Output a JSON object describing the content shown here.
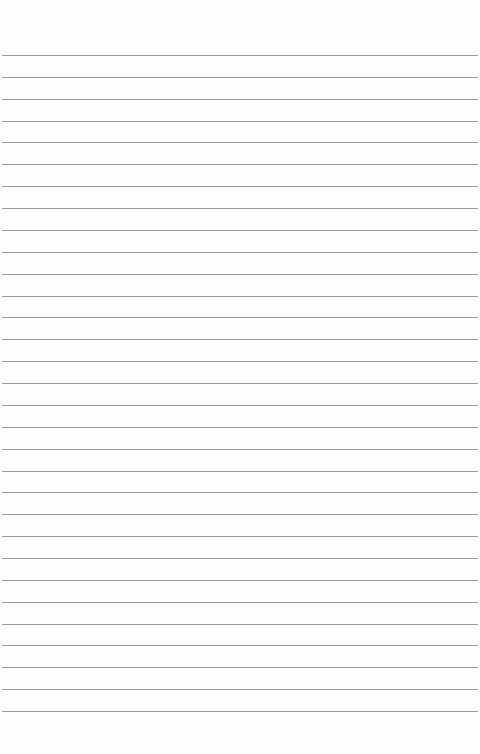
{
  "paper": {
    "type": "lined-paper",
    "background": "#fefefe",
    "line_color": "#9a9a9a",
    "line_count": 31,
    "first_line_y": 55,
    "line_spacing": 21.87
  }
}
